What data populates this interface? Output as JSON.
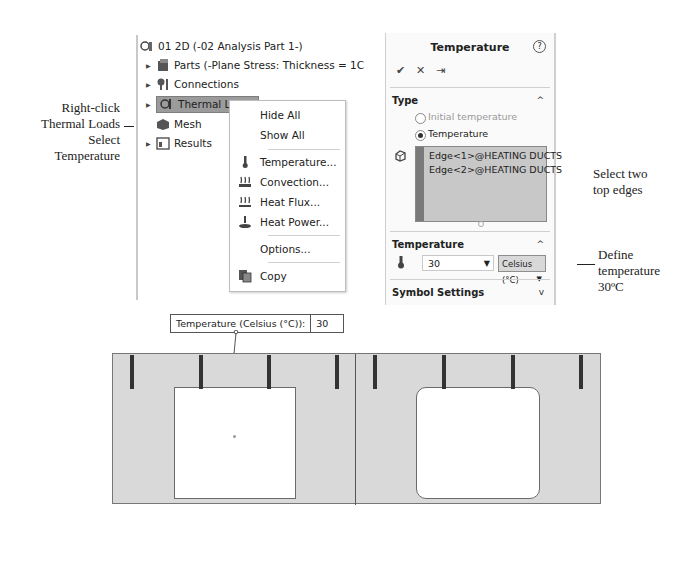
{
  "annotations": {
    "left": [
      "Right-click",
      "Thermal Loads",
      "Select",
      "Temperature"
    ],
    "select_edges": [
      "Select two",
      "top edges"
    ],
    "define_temp": [
      "Define",
      "temperature",
      "30ºC"
    ]
  },
  "tree": {
    "root": "01 2D (-02 Analysis Part 1-)",
    "items": [
      {
        "label": "Parts (-Plane Stress: Thickness = 1C",
        "icon": "parts-icon",
        "expandable": true
      },
      {
        "label": "Connections",
        "icon": "connections-icon",
        "expandable": true
      },
      {
        "label": "Thermal Loads",
        "icon": "thermal-loads-icon",
        "expandable": true,
        "selected": true
      },
      {
        "label": "Mesh",
        "icon": "mesh-icon",
        "expandable": false
      },
      {
        "label": "Results",
        "icon": "results-icon",
        "expandable": true
      }
    ]
  },
  "context_menu": {
    "items": [
      {
        "label": "Hide All",
        "icon": ""
      },
      {
        "label": "Show All",
        "icon": ""
      },
      {
        "label": "Temperature...",
        "icon": "thermometer-icon"
      },
      {
        "label": "Convection...",
        "icon": "convection-icon"
      },
      {
        "label": "Heat Flux...",
        "icon": "heat-flux-icon"
      },
      {
        "label": "Heat Power...",
        "icon": "heat-power-icon"
      },
      {
        "label": "Options...",
        "icon": ""
      },
      {
        "label": "Copy",
        "icon": "copy-icon"
      }
    ]
  },
  "property_manager": {
    "title": "Temperature",
    "help": "?",
    "ok": "✔",
    "cancel": "✕",
    "pin": "⇥",
    "type_section": {
      "heading": "Type",
      "options": [
        {
          "label": "Initial temperature",
          "selected": false
        },
        {
          "label": "Temperature",
          "selected": true
        }
      ],
      "selections": [
        "Edge<1>@HEATING DUCTS",
        "Edge<2>@HEATING DUCTS"
      ]
    },
    "temperature_section": {
      "heading": "Temperature",
      "value": "30",
      "unit": "Celsius (°C)"
    },
    "symbol_section": {
      "heading": "Symbol Settings"
    }
  },
  "graphics": {
    "callout_label": "Temperature (Celsius (°C)):",
    "callout_value": "30"
  }
}
